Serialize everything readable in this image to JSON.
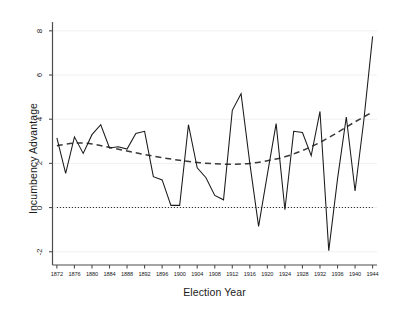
{
  "chart_data": {
    "type": "line",
    "title": "",
    "xlabel": "Election Year",
    "ylabel": "Incumbency Advantage",
    "xlim": [
      1871,
      1945
    ],
    "ylim": [
      -2.6,
      8.4
    ],
    "xticks": [
      1872,
      1876,
      1880,
      1884,
      1888,
      1892,
      1896,
      1900,
      1904,
      1908,
      1912,
      1916,
      1920,
      1924,
      1928,
      1932,
      1936,
      1940,
      1944
    ],
    "yticks": [
      -2,
      0,
      2,
      4,
      6,
      8
    ],
    "grid": "horizontal-light",
    "legend": "none",
    "series": [
      {
        "name": "Incumbency Advantage",
        "style": "solid",
        "color": "#1a1a1a",
        "x": [
          1872,
          1874,
          1876,
          1878,
          1880,
          1882,
          1884,
          1886,
          1888,
          1890,
          1892,
          1894,
          1896,
          1898,
          1900,
          1902,
          1904,
          1906,
          1908,
          1910,
          1912,
          1914,
          1916,
          1918,
          1920,
          1922,
          1924,
          1926,
          1928,
          1930,
          1932,
          1934,
          1936,
          1938,
          1940,
          1942,
          1944
        ],
        "values": [
          3.15,
          1.55,
          3.2,
          2.45,
          3.3,
          3.75,
          2.7,
          2.75,
          2.65,
          3.35,
          3.45,
          1.4,
          1.25,
          0.1,
          0.1,
          3.75,
          1.8,
          1.35,
          0.55,
          0.35,
          4.4,
          5.15,
          2.0,
          -0.85,
          1.5,
          3.8,
          -0.1,
          3.45,
          3.4,
          2.35,
          4.35,
          -1.95,
          1.3,
          4.1,
          0.75,
          3.95,
          7.75
        ]
      },
      {
        "name": "Quadratic Trend",
        "style": "dashed",
        "color": "#3a3a3a",
        "x": [
          1872,
          1876,
          1880,
          1884,
          1888,
          1892,
          1896,
          1900,
          1904,
          1908,
          1912,
          1916,
          1920,
          1924,
          1928,
          1932,
          1936,
          1940,
          1944
        ],
        "values": [
          2.8,
          2.92,
          2.88,
          2.72,
          2.56,
          2.4,
          2.26,
          2.14,
          2.04,
          1.98,
          1.96,
          2.0,
          2.12,
          2.3,
          2.58,
          2.95,
          3.4,
          3.88,
          4.33
        ]
      },
      {
        "name": "Zero Reference",
        "style": "dotted",
        "color": "#1a1a1a",
        "x": [
          1872,
          1944
        ],
        "values": [
          0,
          0
        ]
      }
    ]
  },
  "axes": {
    "ylabel": "Incumbency Advantage",
    "xlabel": "Election Year",
    "ytick_labels": [
      "-2",
      "0",
      "2",
      "4",
      "6",
      "8"
    ],
    "xtick_labels": [
      "1872",
      "1876",
      "1880",
      "1884",
      "1888",
      "1892",
      "1896",
      "1900",
      "1904",
      "1908",
      "1912",
      "1916",
      "1920",
      "1924",
      "1928",
      "1932",
      "1936",
      "1940",
      "1944"
    ]
  },
  "colors": {
    "background": "#ffffff",
    "axis": "#4d4d4d",
    "series_line": "#1a1a1a",
    "trend_line": "#3a3a3a",
    "grid": "#f0f0f0"
  }
}
